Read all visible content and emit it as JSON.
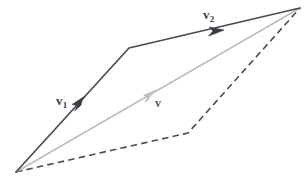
{
  "figure": {
    "name": "vector-addition-parallelogram",
    "width": 306,
    "height": 183,
    "background_color": "#ffffff"
  },
  "labels": {
    "v1": {
      "base": "v",
      "subscript": "1",
      "color": "#3b3b44"
    },
    "v2": {
      "base": "v",
      "subscript": "2",
      "color": "#3b3b44"
    },
    "v": {
      "base": "v",
      "subscript": "",
      "color": "#55555c"
    }
  },
  "colors": {
    "solid_dark": "#4a4a52",
    "resultant_gray": "#bcbcbc",
    "dashed_dark": "#4a4a58",
    "background": "#ffffff"
  },
  "geometry": {
    "origin": {
      "x": 16,
      "y": 172
    },
    "bend_vertex": {
      "x": 129,
      "y": 48
    },
    "apex": {
      "x": 300,
      "y": 8
    },
    "dashed_bend": {
      "x": 188,
      "y": 133
    }
  },
  "chart_data": {
    "type": "diagram",
    "title": "",
    "points": {
      "O": [
        16,
        172
      ],
      "A": [
        129,
        48
      ],
      "C": [
        300,
        8
      ],
      "B": [
        188,
        133
      ]
    },
    "paths": [
      {
        "name": "v1-segment",
        "style": "solid",
        "color": "#4a4a52",
        "width": 1.6,
        "from": [
          16,
          172
        ],
        "to": [
          129,
          48
        ],
        "arrow_at": [
          82,
          103
        ],
        "label": "v1"
      },
      {
        "name": "v2-segment",
        "style": "solid",
        "color": "#4a4a52",
        "width": 1.6,
        "from": [
          129,
          48
        ],
        "to": [
          300,
          8
        ],
        "arrow_at": [
          218,
          32
        ],
        "label": "v2"
      },
      {
        "name": "resultant-v",
        "style": "solid",
        "color": "#bcbcbc",
        "width": 1.4,
        "from": [
          16,
          172
        ],
        "to": [
          300,
          8
        ],
        "arrow_at": [
          152,
          93
        ],
        "label": "v"
      },
      {
        "name": "dashed-lower-first",
        "style": "dashed",
        "color": "#4a4a58",
        "width": 1.5,
        "from": [
          16,
          172
        ],
        "to": [
          188,
          133
        ],
        "arrow_at": null,
        "label": ""
      },
      {
        "name": "dashed-lower-second",
        "style": "dashed",
        "color": "#4a4a58",
        "width": 1.5,
        "from": [
          188,
          133
        ],
        "to": [
          300,
          8
        ],
        "arrow_at": null,
        "label": ""
      }
    ],
    "legend": [],
    "xlabel": "",
    "ylabel": "",
    "grid": false
  }
}
